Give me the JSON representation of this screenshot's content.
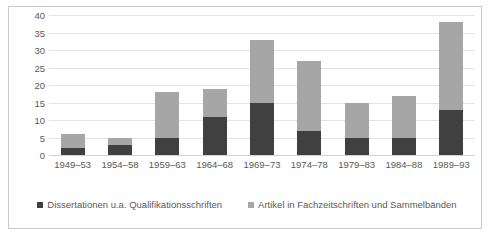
{
  "chart_data": {
    "type": "bar",
    "subtype": "stacked-column",
    "title": "",
    "xlabel": "",
    "ylabel": "",
    "ylim": [
      0,
      40
    ],
    "ytick_step": 5,
    "yticks": [
      40,
      35,
      30,
      25,
      20,
      15,
      10,
      5,
      0
    ],
    "grid": true,
    "legend_position": "bottom",
    "categories": [
      "1949–53",
      "1954–58",
      "1959–63",
      "1964–68",
      "1969–73",
      "1974–78",
      "1979–83",
      "1984–88",
      "1989–93"
    ],
    "series": [
      {
        "name": "Dissertationen u.a. Qualifikationsschriften",
        "color": "#404040",
        "values": [
          2,
          3,
          5,
          11,
          15,
          7,
          5,
          5,
          13
        ]
      },
      {
        "name": "Artikel in Fachzeitschriften und Sammelbänden",
        "color": "#a6a6a6",
        "values": [
          4,
          2,
          13,
          8,
          18,
          20,
          10,
          12,
          25
        ]
      }
    ],
    "totals": [
      6,
      5,
      18,
      19,
      33,
      27,
      15,
      17,
      38
    ]
  },
  "legend": {
    "items": [
      {
        "label": "Dissertationen u.a. Qualifikationsschriften",
        "color": "#404040",
        "marker": "square-marker"
      },
      {
        "label": "Artikel in Fachzeitschriften und Sammelbänden",
        "color": "#a6a6a6",
        "marker": "square-marker"
      }
    ]
  },
  "colors": {
    "series_dark": "#404040",
    "series_light": "#a6a6a6",
    "gridline": "#e4e4e4",
    "axis_text": "#5a5a5a",
    "frame_border": "#c9c9c9",
    "background": "#ffffff"
  }
}
